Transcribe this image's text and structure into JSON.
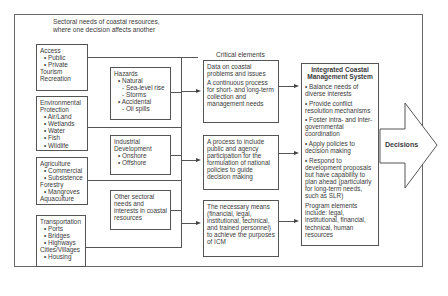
{
  "header": {
    "sectoral_title_line1": "Sectoral needs of coastal resources,",
    "sectoral_title_line2": "where one decision affects another",
    "critical_title": "Critical elements"
  },
  "sectors": [
    {
      "lines": [
        {
          "t": "Access",
          "l": 0
        },
        {
          "t": "• Public",
          "l": 1
        },
        {
          "t": "• Private",
          "l": 1
        },
        {
          "t": "Tourism",
          "l": 0
        },
        {
          "t": "Recreation",
          "l": 0
        }
      ]
    },
    {
      "lines": [
        {
          "t": "Environmental",
          "l": 0
        },
        {
          "t": "Protection",
          "l": 0
        },
        {
          "t": "• Air/Land",
          "l": 1
        },
        {
          "t": "• Wetlands",
          "l": 1
        },
        {
          "t": "• Water",
          "l": 1
        },
        {
          "t": "• Fish",
          "l": 1
        },
        {
          "t": "• Wildlife",
          "l": 1
        }
      ]
    },
    {
      "lines": [
        {
          "t": "Agriculture",
          "l": 0
        },
        {
          "t": "• Commercial",
          "l": 1
        },
        {
          "t": "• Subsistence",
          "l": 1
        },
        {
          "t": "Forestry",
          "l": 0
        },
        {
          "t": "• Mangroves",
          "l": 1
        },
        {
          "t": "Aquaculture",
          "l": 0
        }
      ]
    },
    {
      "lines": [
        {
          "t": "Transportation",
          "l": 0
        },
        {
          "t": "• Ports",
          "l": 1
        },
        {
          "t": "• Bridges",
          "l": 1
        },
        {
          "t": "• Highways",
          "l": 1
        },
        {
          "t": "Cities/Villages",
          "l": 0
        },
        {
          "t": "• Housing",
          "l": 1
        }
      ]
    }
  ],
  "issues": [
    {
      "lines": [
        {
          "t": "Hazards",
          "l": 0
        },
        {
          "t": "• Natural",
          "l": 1
        },
        {
          "t": "- Sea-level rise",
          "l": 2
        },
        {
          "t": "- Storms",
          "l": 2
        },
        {
          "t": "• Accidental",
          "l": 1
        },
        {
          "t": "- Oil spills",
          "l": 2
        }
      ]
    },
    {
      "lines": [
        {
          "t": "Industrial",
          "l": 0
        },
        {
          "t": "Development",
          "l": 0
        },
        {
          "t": "• Onshore",
          "l": 1
        },
        {
          "t": "• Offshore",
          "l": 1
        }
      ]
    },
    {
      "lines": [
        {
          "t": "Other sectoral",
          "l": 0
        },
        {
          "t": "needs and",
          "l": 0
        },
        {
          "t": "interests in coastal",
          "l": 0
        },
        {
          "t": "resources",
          "l": 0
        }
      ]
    }
  ],
  "critical_elements": [
    {
      "paras": [
        "Data on coastal problems and issues",
        "A continuous process for short- and long-term collection and management needs"
      ]
    },
    {
      "paras": [
        "A process to include public and agency participation for the formulation of national policies to guide decision making"
      ]
    },
    {
      "paras": [
        "The necessary means (financial, legal, institutional, technical, and trained personnel) to achieve the purposes of ICM"
      ]
    }
  ],
  "icm": {
    "title_line1": "Integrated Coastal",
    "title_line2": "Management System",
    "items": [
      "• Balance needs of diverse interests",
      "• Provide conflict resolution mechanisms",
      "• Foster intra- and inter-governmental coordination",
      "• Apply policies to decision making",
      "• Respond to development proposals but have capability to plan ahead (particularly for long-term needs, such as SLR)"
    ],
    "program": "Program elements include: legal, institutional, financial, technical, human resources"
  },
  "output": {
    "label": "Decisions"
  },
  "colors": {
    "line": "#555555",
    "text": "#3a3a3a",
    "background": "#ffffff"
  }
}
